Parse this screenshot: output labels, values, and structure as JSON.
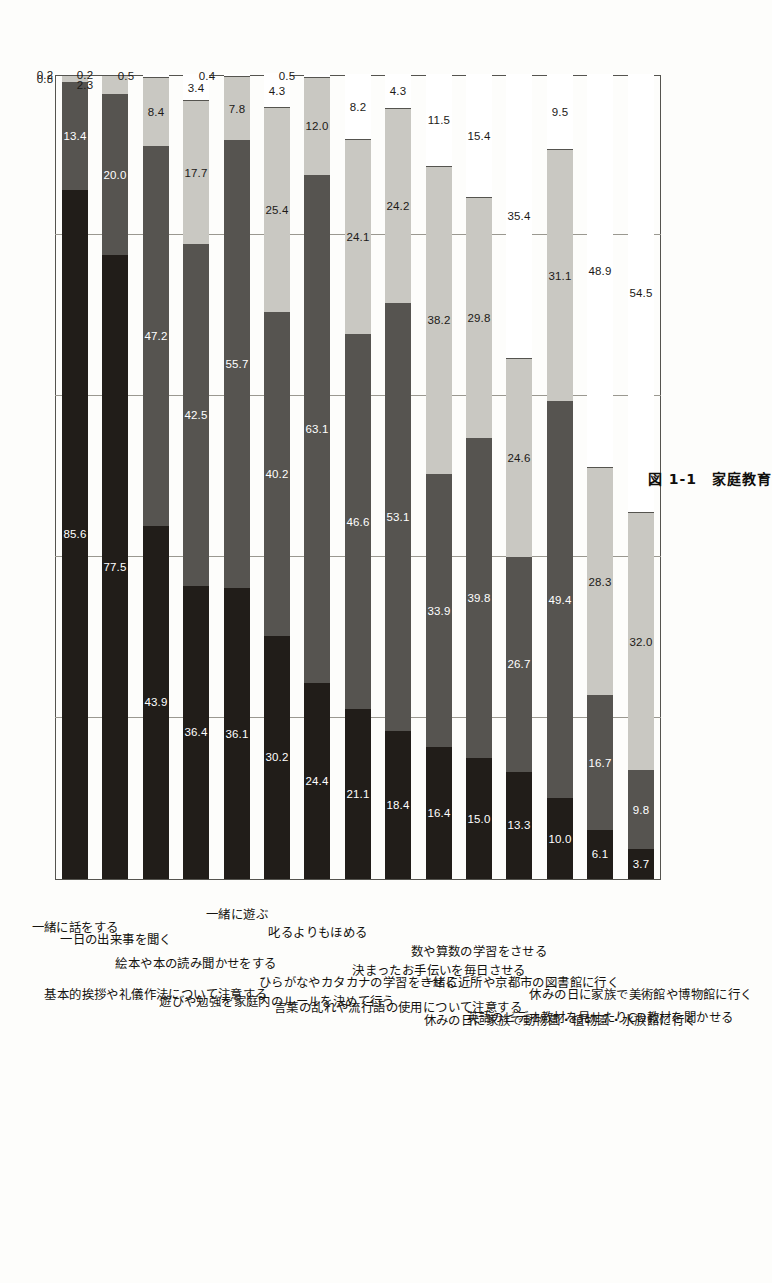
{
  "figure": {
    "caption": "図 1-1　家庭教育",
    "caption_number": "図 1-1",
    "caption_title": "家庭教育"
  },
  "axis": {
    "ticks": [
      "0%",
      "20%",
      "40%",
      "60%",
      "80%",
      "100%"
    ],
    "tick_values": [
      0,
      20,
      40,
      60,
      80,
      100
    ]
  },
  "chart_data": {
    "type": "bar",
    "orientation": "horizontal-stacked",
    "title": "図 1-1　家庭教育",
    "xlabel": "",
    "ylabel": "",
    "xlim": [
      0,
      100
    ],
    "grid": true,
    "legend_position": "none",
    "stacked_percent": true,
    "categories": [
      "一緒に話をする",
      "一日の出来事を聞く",
      "基本的挨拶や礼儀作法について注意する",
      "絵本や本の読み聞かせをする",
      "一緒に遊ぶ",
      "遊びや勉強を家庭内のルールを決めて行う",
      "叱るよりもほめる",
      "ひらがなやカタカナの学習をさせる",
      "言葉の乱れや流行語の使用について注意する",
      "決まったお手伝いを毎日させる",
      "数や算数の学習をさせる",
      "一緒に近所や京都市の図書館に行く",
      "休みの日に家族で動物園・植物園・水族館に行く",
      "英語のビデオ教材を見せたりCD教材を聞かせる",
      "休みの日に家族で美術館や博物館に行く"
    ],
    "series": [
      {
        "name": "seg1",
        "color": "#211d19",
        "values": [
          85.6,
          77.5,
          43.9,
          36.4,
          36.1,
          30.2,
          24.4,
          21.1,
          18.4,
          16.4,
          15.0,
          13.3,
          10.0,
          6.1,
          3.7
        ]
      },
      {
        "name": "seg2",
        "color": "#565450",
        "values": [
          13.4,
          20.0,
          47.2,
          42.5,
          55.7,
          40.2,
          63.1,
          46.6,
          53.1,
          33.9,
          39.8,
          26.7,
          49.4,
          16.7,
          9.8
        ]
      },
      {
        "name": "seg3",
        "color": "#c9c8c2",
        "values": [
          0.8,
          2.3,
          8.4,
          17.7,
          7.8,
          25.4,
          12.0,
          24.1,
          24.2,
          38.2,
          29.8,
          24.6,
          31.1,
          28.3,
          32.0
        ]
      },
      {
        "name": "seg4",
        "color": "#ffffff",
        "values": [
          0.2,
          0.2,
          0.5,
          3.4,
          0.4,
          4.3,
          0.5,
          8.2,
          4.3,
          11.5,
          15.4,
          35.4,
          9.5,
          48.9,
          54.5
        ]
      }
    ],
    "rows": [
      {
        "label": "一緒に話をする",
        "values": [
          85.6,
          13.4,
          0.8,
          0.2
        ],
        "labels": [
          "85.6",
          "13.4",
          "0.8",
          "0.2"
        ]
      },
      {
        "label": "一日の出来事を聞く",
        "values": [
          77.5,
          20.0,
          2.3,
          0.2
        ],
        "labels": [
          "77.5",
          "20.0",
          "2.3",
          "0.2"
        ]
      },
      {
        "label": "基本的挨拶や礼儀作法について注意する",
        "values": [
          43.9,
          47.2,
          8.4,
          0.5
        ],
        "labels": [
          "43.9",
          "47.2",
          "8.4",
          "0.5"
        ]
      },
      {
        "label": "絵本や本の読み聞かせをする",
        "values": [
          36.4,
          42.5,
          17.7,
          3.4
        ],
        "labels": [
          "36.4",
          "42.5",
          "17.7",
          "3.4"
        ]
      },
      {
        "label": "一緒に遊ぶ",
        "values": [
          36.1,
          55.7,
          7.8,
          0.4
        ],
        "labels": [
          "36.1",
          "55.7",
          "7.8",
          "0.4"
        ]
      },
      {
        "label": "遊びや勉強を家庭内のルールを決めて行う",
        "values": [
          30.2,
          40.2,
          25.4,
          4.3
        ],
        "labels": [
          "30.2",
          "40.2",
          "25.4",
          "4.3"
        ]
      },
      {
        "label": "叱るよりもほめる",
        "values": [
          24.4,
          63.1,
          12.0,
          0.5
        ],
        "labels": [
          "24.4",
          "63.1",
          "12.0",
          "0.5"
        ]
      },
      {
        "label": "ひらがなやカタカナの学習をさせる",
        "values": [
          21.1,
          46.6,
          24.1,
          8.2
        ],
        "labels": [
          "21.1",
          "46.6",
          "24.1",
          "8.2"
        ]
      },
      {
        "label": "言葉の乱れや流行語の使用について注意する",
        "values": [
          18.4,
          53.1,
          24.2,
          4.3
        ],
        "labels": [
          "18.4",
          "53.1",
          "24.2",
          "4.3"
        ]
      },
      {
        "label": "決まったお手伝いを毎日させる",
        "values": [
          16.4,
          33.9,
          38.2,
          11.5
        ],
        "labels": [
          "16.4",
          "33.9",
          "38.2",
          "11.5"
        ]
      },
      {
        "label": "数や算数の学習をさせる",
        "values": [
          15.0,
          39.8,
          29.8,
          15.4
        ],
        "labels": [
          "15.0",
          "39.8",
          "29.8",
          "15.4"
        ]
      },
      {
        "label": "一緒に近所や京都市の図書館に行く",
        "values": [
          13.3,
          26.7,
          24.6,
          35.4
        ],
        "labels": [
          "13.3",
          "26.7",
          "24.6",
          "35.4"
        ]
      },
      {
        "label": "休みの日に家族で動物園・植物園・水族館に行く",
        "values": [
          10.0,
          49.4,
          31.1,
          9.5
        ],
        "labels": [
          "10.0",
          "49.4",
          "31.1",
          "9.5"
        ]
      },
      {
        "label": "英語のビデオ教材を見せたりCD教材を聞かせる",
        "values": [
          6.1,
          16.7,
          28.3,
          48.9
        ],
        "labels": [
          "6.1",
          "16.7",
          "28.3",
          "48.9"
        ]
      },
      {
        "label": "休みの日に家族で美術館や博物館に行く",
        "values": [
          3.7,
          9.8,
          32.0,
          54.5
        ],
        "labels": [
          "3.7",
          "9.8",
          "32.0",
          "54.5"
        ]
      }
    ]
  }
}
